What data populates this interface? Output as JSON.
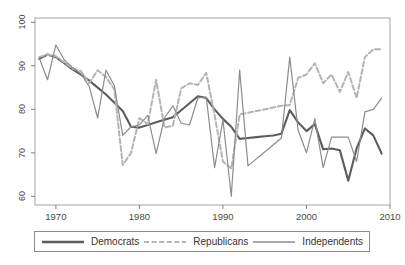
{
  "chart_data": {
    "type": "line",
    "title": "",
    "subtitle": "",
    "xlabel": "",
    "ylabel": "",
    "xlim": [
      1967.5,
      2010
    ],
    "ylim": [
      58,
      101
    ],
    "xticks": [
      1970,
      1980,
      1990,
      2000,
      2010
    ],
    "yticks": [
      60,
      70,
      80,
      90,
      100
    ],
    "grid": false,
    "legend_position": "below-axis",
    "legend_entries": [
      "Democrats",
      "Republicans",
      "Independents"
    ],
    "series": [
      {
        "name": "Democrats",
        "color": "#5c5c5c",
        "style": "solid",
        "width": 2.1,
        "x": [
          1968,
          1969,
          1970,
          1971,
          1972,
          1973,
          1974,
          1975,
          1976,
          1977,
          1978,
          1979,
          1980,
          1981,
          1982,
          1983,
          1984,
          1985,
          1986,
          1987,
          1988,
          1989,
          1990,
          1991,
          1992,
          1993,
          1994,
          1995,
          1996,
          1997,
          1998,
          1999,
          2000,
          2001,
          2002,
          2003,
          2004,
          2005,
          2006,
          2007,
          2008,
          2009
        ],
        "y": [
          91.6,
          92.6,
          92.0,
          90.6,
          89.2,
          88.0,
          86.6,
          85.0,
          83.4,
          81.5,
          79.6,
          76.0,
          75.8,
          76.4,
          77.0,
          77.6,
          78.2,
          79.8,
          81.4,
          83.0,
          82.6,
          80.0,
          77.8,
          76.0,
          73.2,
          73.4,
          73.6,
          73.8,
          74.0,
          74.4,
          79.8,
          77.0,
          75.0,
          76.6,
          70.8,
          71.0,
          70.6,
          63.6,
          71.0,
          75.6,
          74.0,
          69.8
        ]
      },
      {
        "name": "Republicans",
        "color": "#b4b4b4",
        "style": "dashed",
        "width": 2.0,
        "x": [
          1968,
          1969,
          1970,
          1971,
          1972,
          1973,
          1974,
          1975,
          1976,
          1977,
          1978,
          1979,
          1980,
          1981,
          1982,
          1983,
          1984,
          1985,
          1986,
          1987,
          1988,
          1989,
          1990,
          1991,
          1992,
          1993,
          1994,
          1995,
          1996,
          1997,
          1998,
          1999,
          2000,
          2001,
          2002,
          2003,
          2004,
          2005,
          2006,
          2007,
          2008,
          2009
        ],
        "y": [
          92.0,
          92.6,
          92.2,
          90.8,
          89.4,
          88.8,
          86.0,
          89.0,
          87.4,
          84.6,
          67.2,
          70.0,
          78.0,
          76.6,
          86.8,
          75.8,
          76.2,
          84.8,
          86.0,
          85.6,
          88.4,
          78.6,
          68.0,
          66.4,
          78.8,
          79.2,
          79.6,
          80.0,
          80.4,
          80.8,
          81.0,
          87.2,
          88.0,
          90.6,
          86.0,
          88.0,
          84.0,
          88.6,
          82.6,
          92.0,
          93.8,
          93.8
        ]
      },
      {
        "name": "Independents",
        "color": "#8c8c8c",
        "style": "solid",
        "width": 1.2,
        "x": [
          1968,
          1969,
          1970,
          1971,
          1972,
          1973,
          1974,
          1975,
          1976,
          1977,
          1978,
          1979,
          1980,
          1981,
          1982,
          1983,
          1984,
          1985,
          1986,
          1987,
          1988,
          1989,
          1990,
          1991,
          1992,
          1993,
          1994,
          1995,
          1996,
          1997,
          1998,
          1999,
          2000,
          2001,
          2002,
          2003,
          2004,
          2005,
          2006,
          2007,
          2008,
          2009
        ],
        "y": [
          91.8,
          86.8,
          94.8,
          91.4,
          89.6,
          88.2,
          85.2,
          78.0,
          89.0,
          85.4,
          74.0,
          76.0,
          76.4,
          78.6,
          69.8,
          78.0,
          80.8,
          76.8,
          76.4,
          82.6,
          82.8,
          66.6,
          77.6,
          60.0,
          89.0,
          67.0,
          68.6,
          70.2,
          71.8,
          73.4,
          92.0,
          75.2,
          70.0,
          77.8,
          66.6,
          73.6,
          73.6,
          73.6,
          68.0,
          79.4,
          80.0,
          82.6
        ]
      }
    ]
  },
  "legend": {
    "items": [
      {
        "label": "Democrats",
        "color": "#5c5c5c",
        "style": "solid"
      },
      {
        "label": "Republicans",
        "color": "#b4b4b4",
        "style": "dashed"
      },
      {
        "label": "Independents",
        "color": "#8c8c8c",
        "style": "solid"
      }
    ]
  },
  "axis": {
    "x_tick_labels": [
      "1970",
      "1980",
      "1990",
      "2000",
      "2010"
    ],
    "y_tick_labels": [
      "60",
      "70",
      "80",
      "90",
      "100"
    ]
  }
}
